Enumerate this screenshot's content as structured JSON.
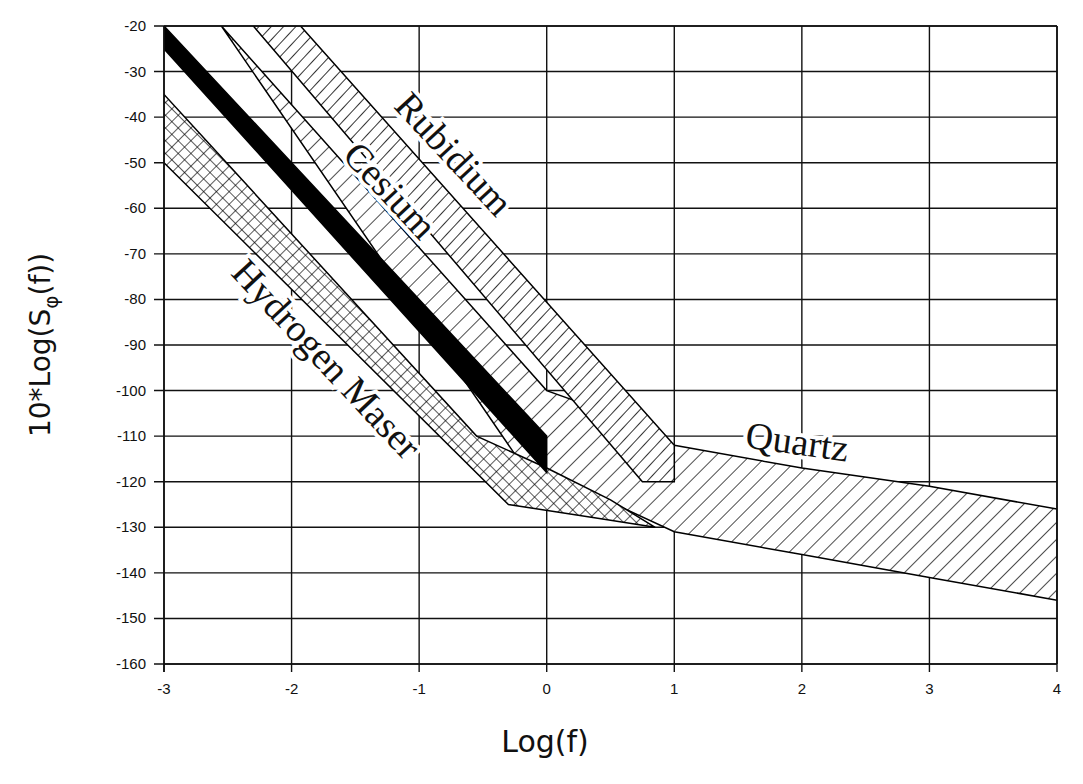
{
  "chart_data": {
    "type": "area",
    "title": "",
    "xlabel": "Log(f)",
    "ylabel": "10*Log(S_φ(f))",
    "ylabel_parts": {
      "prefix": "10*Log(S",
      "sub": "φ",
      "suffix": "(f))"
    },
    "xlim": [
      -3,
      4
    ],
    "ylim": [
      -160,
      -20
    ],
    "x_ticks": [
      -3,
      -2,
      -1,
      0,
      1,
      2,
      3,
      4
    ],
    "y_ticks": [
      -20,
      -30,
      -40,
      -50,
      -60,
      -70,
      -80,
      -90,
      -100,
      -110,
      -120,
      -130,
      -140,
      -150,
      -160
    ],
    "grid": true,
    "legend": "inline labels",
    "series": [
      {
        "name": "Rubidium",
        "fill": "vertical-hatch",
        "upper": [
          [
            -1.93,
            -20
          ],
          [
            1.0,
            -112
          ]
        ],
        "lower": [
          [
            -2.3,
            -20
          ],
          [
            0.75,
            -120
          ],
          [
            1.0,
            -120
          ]
        ]
      },
      {
        "name": "Cesium",
        "fill": "solid-black",
        "upper": [
          [
            -3.0,
            -20
          ],
          [
            0.0,
            -110
          ]
        ],
        "lower": [
          [
            -3.0,
            -25
          ],
          [
            0.0,
            -118
          ]
        ]
      },
      {
        "name": "Quartz",
        "fill": "diagonal-hatch",
        "upper": [
          [
            -2.55,
            -20
          ],
          [
            0.0,
            -100
          ],
          [
            0.5,
            -105
          ],
          [
            1.0,
            -112
          ],
          [
            2.0,
            -117
          ],
          [
            3.0,
            -121
          ],
          [
            4.0,
            -126
          ]
        ],
        "lower": [
          [
            -2.55,
            -20
          ],
          [
            -0.2,
            -116
          ],
          [
            0.0,
            -118
          ],
          [
            1.0,
            -131
          ],
          [
            2.0,
            -136
          ],
          [
            3.0,
            -141
          ],
          [
            4.0,
            -146
          ]
        ]
      },
      {
        "name": "Hydrogen Maser",
        "fill": "cross-hatch",
        "upper": [
          [
            -3.0,
            -35
          ],
          [
            -0.55,
            -110
          ],
          [
            0.0,
            -117
          ],
          [
            0.5,
            -124
          ],
          [
            0.85,
            -130
          ]
        ],
        "lower": [
          [
            -3.0,
            -50
          ],
          [
            -0.3,
            -125
          ],
          [
            0.4,
            -128
          ],
          [
            0.85,
            -130
          ]
        ]
      }
    ],
    "annotations": [
      {
        "text": "Rubidium",
        "x": -0.8,
        "y": -50,
        "rotation": 47
      },
      {
        "text": "Cesium",
        "x": -1.3,
        "y": -58,
        "rotation": 47
      },
      {
        "text": "Hydrogen Maser",
        "x": -1.8,
        "y": -95,
        "rotation": 47
      },
      {
        "text": "Quartz",
        "x": 1.95,
        "y": -114,
        "rotation": 8
      }
    ]
  }
}
